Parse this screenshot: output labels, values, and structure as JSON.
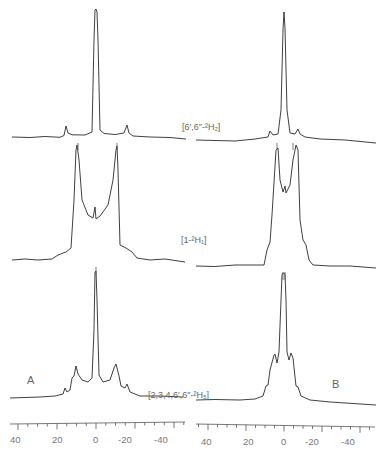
{
  "figure": {
    "panel_letters": {
      "left": "A",
      "right": "B"
    },
    "spectrum_labels": [
      {
        "id": "top",
        "text": "[6′,6″-²H₂]"
      },
      {
        "id": "middle",
        "text": "[1-²H₁]"
      },
      {
        "id": "bottom",
        "text": "[2,3,4,6′,6″-²H₅]"
      }
    ],
    "axis": {
      "ticks": [
        "40",
        "20",
        "0",
        "-20",
        "-40"
      ],
      "unit_hint": "kHz"
    },
    "colors": {
      "trace": "#2a2a2a",
      "axis": "#555555",
      "text": "#777777"
    }
  },
  "chart_data": {
    "type": "line",
    "title": "",
    "xlabel": "",
    "xlim": [
      50,
      -50
    ],
    "x_ticks": [
      40,
      20,
      0,
      -20,
      -40
    ],
    "grid": false,
    "panels": [
      {
        "name": "A",
        "series": [
          {
            "name": "[6′,6″-²H₂]",
            "peaks_kHz": [
              17,
              0,
              -17
            ],
            "relative_height": [
              0.08,
              1.0,
              0.08
            ],
            "shape": "central narrow line with small satellites"
          },
          {
            "name": "[1-²H₁]",
            "peaks_kHz": [
              10,
              0,
              -11
            ],
            "relative_height": [
              1.0,
              0.3,
              1.0
            ],
            "shape": "Pake doublet with shoulders near ±19"
          },
          {
            "name": "[2,3,4,6′,6″-²H₅]",
            "peaks_kHz": [
              18,
              13,
              11,
              0,
              -10,
              -12,
              -18
            ],
            "relative_height": [
              0.08,
              0.25,
              0.35,
              1.0,
              0.35,
              0.25,
              0.08
            ],
            "shape": "central line with multiple quadrupolar splittings"
          }
        ]
      },
      {
        "name": "B",
        "series": [
          {
            "name": "[6′,6″-²H₂]",
            "peaks_kHz": [
              5,
              0,
              -5
            ],
            "relative_height": [
              0.08,
              1.0,
              0.08
            ],
            "shape": "central narrow line with small satellites"
          },
          {
            "name": "[1-²H₁]",
            "peaks_kHz": [
              3,
              0,
              -4
            ],
            "relative_height": [
              1.0,
              0.55,
              1.0
            ],
            "shape": "narrow doublet with shoulders near ±7"
          },
          {
            "name": "[2,3,4,6′,6″-²H₅]",
            "peaks_kHz": [
              5,
              0,
              -4
            ],
            "relative_height": [
              0.4,
              1.0,
              0.4
            ],
            "shape": "central line with shoulders"
          }
        ]
      }
    ]
  }
}
